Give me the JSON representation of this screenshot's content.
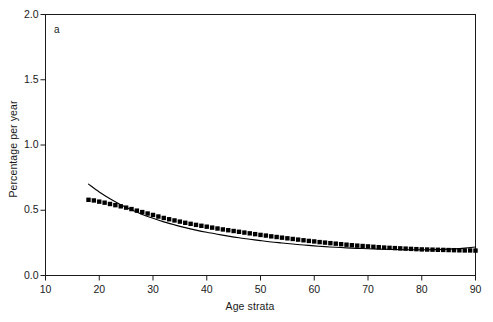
{
  "panel": {
    "label": "a"
  },
  "axes": {
    "ylabel": "Percentage per year",
    "xlabel": "Age strata",
    "yticks": [
      "0.0",
      "0.5",
      "1.0",
      "1.5",
      "2.0"
    ],
    "xticks": [
      "10",
      "20",
      "30",
      "40",
      "50",
      "60",
      "70",
      "80",
      "90"
    ]
  },
  "chart_data": {
    "type": "line",
    "title": "",
    "subtitle": "",
    "panel_label": "a",
    "xlabel": "Age strata",
    "ylabel": "Percentage per year",
    "xlim": [
      10,
      90
    ],
    "ylim": [
      0.0,
      2.0
    ],
    "xticks": [
      10,
      20,
      30,
      40,
      50,
      60,
      70,
      80,
      90
    ],
    "yticks": [
      0.0,
      0.5,
      1.0,
      1.5,
      2.0
    ],
    "grid": false,
    "legend": "none",
    "frame": "full-box",
    "tick_direction": "out",
    "series": [
      {
        "name": "observed",
        "marker": "filled-square",
        "line": "none",
        "color": "#000000",
        "x": [
          18,
          19,
          20,
          21,
          22,
          23,
          24,
          25,
          26,
          27,
          28,
          29,
          30,
          31,
          32,
          33,
          34,
          35,
          36,
          37,
          38,
          39,
          40,
          41,
          42,
          43,
          44,
          45,
          46,
          47,
          48,
          49,
          50,
          51,
          52,
          53,
          54,
          55,
          56,
          57,
          58,
          59,
          60,
          61,
          62,
          63,
          64,
          65,
          66,
          67,
          68,
          69,
          70,
          71,
          72,
          73,
          74,
          75,
          76,
          77,
          78,
          79,
          80,
          81,
          82,
          83,
          84,
          85,
          86,
          87,
          88,
          89,
          90
        ],
        "values": [
          0.58,
          0.575,
          0.566,
          0.558,
          0.548,
          0.539,
          0.53,
          0.52,
          0.509,
          0.497,
          0.486,
          0.475,
          0.464,
          0.452,
          0.441,
          0.431,
          0.422,
          0.413,
          0.404,
          0.396,
          0.388,
          0.381,
          0.374,
          0.367,
          0.36,
          0.353,
          0.347,
          0.341,
          0.335,
          0.329,
          0.323,
          0.317,
          0.311,
          0.306,
          0.3,
          0.295,
          0.29,
          0.285,
          0.28,
          0.275,
          0.27,
          0.265,
          0.261,
          0.256,
          0.252,
          0.248,
          0.244,
          0.24,
          0.236,
          0.232,
          0.229,
          0.226,
          0.223,
          0.22,
          0.217,
          0.214,
          0.212,
          0.21,
          0.208,
          0.206,
          0.204,
          0.202,
          0.2,
          0.199,
          0.198,
          0.197,
          0.196,
          0.195,
          0.194,
          0.193,
          0.192,
          0.192,
          0.191
        ]
      },
      {
        "name": "fitted",
        "marker": "none",
        "line": "solid",
        "color": "#000000",
        "x": [
          18,
          20,
          22,
          24,
          26,
          28,
          30,
          32,
          34,
          36,
          38,
          40,
          42,
          44,
          46,
          48,
          50,
          52,
          54,
          56,
          58,
          60,
          62,
          64,
          66,
          68,
          70,
          72,
          74,
          76,
          78,
          80,
          82,
          84,
          86,
          88,
          90
        ],
        "values": [
          0.7,
          0.64,
          0.588,
          0.542,
          0.503,
          0.468,
          0.438,
          0.411,
          0.388,
          0.367,
          0.348,
          0.331,
          0.316,
          0.302,
          0.289,
          0.278,
          0.267,
          0.257,
          0.249,
          0.241,
          0.234,
          0.227,
          0.221,
          0.216,
          0.212,
          0.208,
          0.205,
          0.202,
          0.2,
          0.198,
          0.197,
          0.197,
          0.198,
          0.2,
          0.204,
          0.21,
          0.218
        ]
      }
    ]
  }
}
